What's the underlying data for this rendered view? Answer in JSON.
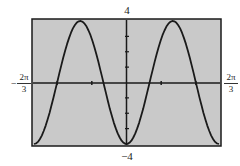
{
  "chart_data": {
    "type": "line",
    "title": "",
    "function": "y = -4cos(3x)",
    "xlabel": "",
    "ylabel": "",
    "xlim": [
      -2.0944,
      2.0944
    ],
    "ylim": [
      -4,
      4
    ],
    "x_tick_labels": {
      "min": {
        "sign": "-",
        "numerator": "2π",
        "denominator": "3"
      },
      "max": {
        "sign": "",
        "numerator": "2π",
        "denominator": "3"
      }
    },
    "y_tick_labels": {
      "max": "4",
      "min": "-4"
    },
    "x": [
      -2.0944,
      -1.5708,
      -1.0472,
      -0.5236,
      0,
      0.5236,
      1.0472,
      1.5708,
      2.0944
    ],
    "y": [
      -4,
      0,
      4,
      0,
      -4,
      0,
      4,
      0,
      -4
    ],
    "x_scale_ticks": 10,
    "y_scale_ticks": 8,
    "grid": false,
    "legend": null,
    "colors": {
      "background": "#c9c9c9",
      "curve": "#1a1a1a",
      "frame": "#1a1a1a"
    }
  },
  "labels": {
    "ymax": "4",
    "ymin": "−4",
    "xmin_sign": "−",
    "xmin_num": "2π",
    "xmin_den": "3",
    "xmax_num": "2π",
    "xmax_den": "3"
  }
}
